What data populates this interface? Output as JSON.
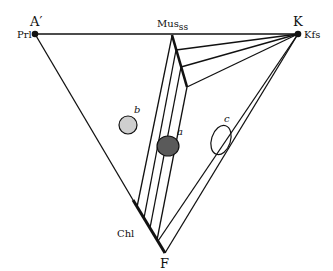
{
  "diagram": {
    "type": "ternary-phase-diagram",
    "vertices": {
      "top_left": {
        "label": "A′",
        "phase": "Prl"
      },
      "top_right": {
        "label": "K",
        "phase": "Kfs"
      },
      "bottom": {
        "label": "F"
      }
    },
    "phase_labels": {
      "muscovite_main": "Mus",
      "muscovite_sub": "ss",
      "chlorite": "Chl"
    },
    "fields": [
      {
        "id": "a",
        "label": "a",
        "fill": "#5a5a5a"
      },
      {
        "id": "b",
        "label": "b",
        "fill": "#cfcfcf"
      },
      {
        "id": "c",
        "label": "c",
        "fill": "none"
      }
    ],
    "colors": {
      "line": "#111111",
      "background": "#ffffff"
    }
  }
}
